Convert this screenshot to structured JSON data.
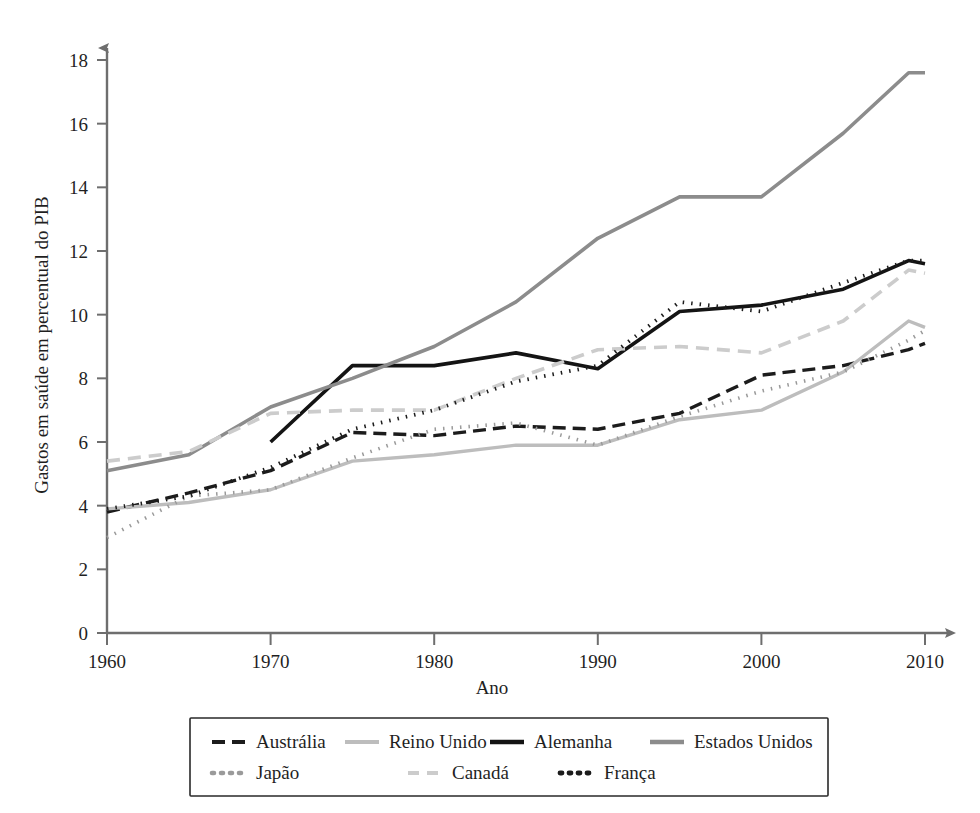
{
  "chart_data": {
    "type": "line",
    "title": "",
    "subtitle": "",
    "xlabel": "Ano",
    "ylabel": "Gastos em saúde em percentual do PIB",
    "xlim": [
      1960,
      2010
    ],
    "ylim": [
      0,
      18
    ],
    "xticks": [
      1960,
      1970,
      1980,
      1990,
      2000,
      2010
    ],
    "yticks": [
      0,
      2,
      4,
      6,
      8,
      10,
      12,
      14,
      16,
      18
    ],
    "xtick_labels": [
      "1960",
      "1970",
      "1980",
      "1990",
      "2000",
      "2010"
    ],
    "ytick_labels": [
      "0",
      "2",
      "4",
      "6",
      "8",
      "10",
      "12",
      "14",
      "16",
      "18"
    ],
    "grid": false,
    "legend_position": "below-plot",
    "series": [
      {
        "name": "Austrália",
        "style": "dashed",
        "color": "#1c1c1c",
        "width": 3.4,
        "dash": "13,7",
        "x": [
          1960,
          1965,
          1970,
          1975,
          1980,
          1985,
          1990,
          1995,
          2000,
          2005,
          2009,
          2010
        ],
        "values": [
          3.8,
          4.4,
          5.1,
          6.3,
          6.2,
          6.5,
          6.4,
          6.9,
          8.1,
          8.4,
          8.9,
          9.1
        ]
      },
      {
        "name": "Reino Unido",
        "style": "solid",
        "color": "#bdbdbd",
        "width": 3.4,
        "dash": "",
        "x": [
          1960,
          1965,
          1970,
          1975,
          1980,
          1985,
          1990,
          1995,
          2000,
          2005,
          2009,
          2010
        ],
        "values": [
          3.9,
          4.1,
          4.5,
          5.4,
          5.6,
          5.9,
          5.9,
          6.7,
          7.0,
          8.2,
          9.8,
          9.6
        ]
      },
      {
        "name": "Alemanha",
        "style": "solid",
        "color": "#141414",
        "width": 3.6,
        "dash": "",
        "x": [
          1970,
          1975,
          1980,
          1985,
          1990,
          1995,
          2000,
          2005,
          2009,
          2010
        ],
        "values": [
          6.0,
          8.4,
          8.4,
          8.8,
          8.3,
          10.1,
          10.3,
          10.8,
          11.7,
          11.6
        ]
      },
      {
        "name": "Estados Unidos",
        "style": "solid",
        "color": "#8c8c8c",
        "width": 3.6,
        "dash": "",
        "x": [
          1960,
          1965,
          1970,
          1975,
          1980,
          1985,
          1990,
          1995,
          2000,
          2005,
          2009,
          2010
        ],
        "values": [
          5.1,
          5.6,
          7.1,
          8.0,
          9.0,
          10.4,
          12.4,
          13.7,
          13.7,
          15.7,
          17.6,
          17.6
        ]
      },
      {
        "name": "Japão",
        "style": "dotted",
        "color": "#9a9a9a",
        "width": 3.6,
        "dash": "1.5,7",
        "x": [
          1960,
          1965,
          1970,
          1975,
          1980,
          1985,
          1990,
          1995,
          2000,
          2005,
          2009,
          2010
        ],
        "values": [
          3.0,
          4.3,
          4.5,
          5.5,
          6.4,
          6.6,
          5.9,
          6.8,
          7.6,
          8.2,
          9.2,
          9.5
        ]
      },
      {
        "name": "Canadá",
        "style": "dashed",
        "color": "#cccccc",
        "width": 3.6,
        "dash": "13,8",
        "x": [
          1960,
          1965,
          1970,
          1975,
          1980,
          1985,
          1990,
          1995,
          2000,
          2005,
          2009,
          2010
        ],
        "values": [
          5.4,
          5.7,
          6.9,
          7.0,
          7.0,
          8.0,
          8.9,
          9.0,
          8.8,
          9.8,
          11.4,
          11.3
        ]
      },
      {
        "name": "França",
        "style": "dotted",
        "color": "#1c1c1c",
        "width": 3.8,
        "dash": "1.5,7",
        "x": [
          1960,
          1965,
          1970,
          1975,
          1980,
          1985,
          1990,
          1995,
          2000,
          2005,
          2009,
          2010
        ],
        "values": [
          3.9,
          4.3,
          5.2,
          6.4,
          7.0,
          7.9,
          8.4,
          10.4,
          10.1,
          11.0,
          11.7,
          11.7
        ]
      }
    ]
  },
  "axes": {
    "y_label": "Gastos em saúde em percentual do PIB",
    "x_label": "Ano"
  },
  "legend": {
    "rows": [
      [
        {
          "label": "Austrália",
          "swatch": "dashed-dark"
        },
        {
          "label": "Reino Unido",
          "swatch": "solid-light"
        },
        {
          "label": "Alemanha",
          "swatch": "solid-dark"
        },
        {
          "label": "Estados Unidos",
          "swatch": "solid-gray"
        }
      ],
      [
        {
          "label": "Japão",
          "swatch": "dotted-gray"
        },
        {
          "label": "Canadá",
          "swatch": "dashed-light"
        },
        {
          "label": "França",
          "swatch": "dotted-dark"
        }
      ]
    ]
  },
  "colors": {
    "axis": "#6e6e6e",
    "text": "#1f1f1f",
    "dark": "#141414",
    "mid_gray": "#8c8c8c",
    "light_gray": "#bdbdbd",
    "lighter_gray": "#cccccc"
  }
}
